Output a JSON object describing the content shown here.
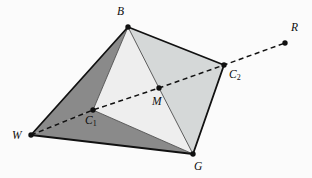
{
  "figure": {
    "type": "geometry-diagram",
    "width": 312,
    "height": 178,
    "background": "#fbfbfb"
  },
  "colors": {
    "stroke": "#111111",
    "dark_face": "#8a8a8a",
    "mid_face": "#d5d8d8",
    "light_face": "#eeeeee",
    "inner_stroke": "#4d4d4d",
    "dash": "#111111",
    "label": "#0d0d0d"
  },
  "points": [
    {
      "id": "W",
      "label": "W",
      "sub": "",
      "x": 31,
      "y": 135,
      "label_x": 12,
      "label_y": 130,
      "dot": true
    },
    {
      "id": "B",
      "label": "B",
      "sub": "",
      "x": 128,
      "y": 27,
      "label_x": 117,
      "label_y": 6,
      "dot": true
    },
    {
      "id": "G",
      "label": "G",
      "sub": "",
      "x": 193,
      "y": 154,
      "label_x": 194,
      "label_y": 161,
      "dot": true
    },
    {
      "id": "C2",
      "label": "C",
      "sub": "2",
      "x": 224,
      "y": 65,
      "label_x": 229,
      "label_y": 69,
      "dot": true
    },
    {
      "id": "C1",
      "label": "C",
      "sub": "1",
      "x": 93,
      "y": 110,
      "label_x": 85,
      "label_y": 115,
      "dot": true
    },
    {
      "id": "M",
      "label": "M",
      "sub": "",
      "x": 159,
      "y": 88,
      "label_x": 152,
      "label_y": 96,
      "dot": true
    },
    {
      "id": "R",
      "label": "R",
      "sub": "",
      "x": 285,
      "y": 43,
      "label_x": 291,
      "label_y": 22,
      "dot": true
    }
  ],
  "faces": [
    {
      "id": "face-W-B-C1",
      "points": "31,135 128,27 93,110",
      "fill": "#8a8a8a",
      "stroke": "none"
    },
    {
      "id": "face-W-C1-G",
      "points": "31,135 93,110 193,154",
      "fill": "#8a8a8a",
      "stroke": "none"
    },
    {
      "id": "face-B-C1-M",
      "points": "128,27 93,110 159,88",
      "fill": "#eeeeee",
      "stroke": "none"
    },
    {
      "id": "face-C1-M-G",
      "points": "93,110 159,88 193,154",
      "fill": "#eeeeee",
      "stroke": "none"
    },
    {
      "id": "face-B-M-C2",
      "points": "128,27 159,88 224,65",
      "fill": "#d5d8d8",
      "stroke": "none"
    },
    {
      "id": "face-M-C2-G",
      "points": "159,88 224,65 193,154",
      "fill": "#d5d8d8",
      "stroke": "none"
    }
  ],
  "inner_edges": [
    {
      "id": "edge-B-C1",
      "x1": 128,
      "y1": 27,
      "x2": 93,
      "y2": 110
    },
    {
      "id": "edge-B-M",
      "x1": 128,
      "y1": 27,
      "x2": 159,
      "y2": 88
    },
    {
      "id": "edge-M-G",
      "x1": 159,
      "y1": 88,
      "x2": 193,
      "y2": 154
    },
    {
      "id": "edge-C1-G",
      "x1": 93,
      "y1": 110,
      "x2": 193,
      "y2": 154
    }
  ],
  "outline_edges": [
    {
      "id": "edge-W-B",
      "x1": 31,
      "y1": 135,
      "x2": 128,
      "y2": 27
    },
    {
      "id": "edge-B-C2",
      "x1": 128,
      "y1": 27,
      "x2": 224,
      "y2": 65
    },
    {
      "id": "edge-C2-G",
      "x1": 224,
      "y1": 65,
      "x2": 193,
      "y2": 154
    },
    {
      "id": "edge-G-W",
      "x1": 193,
      "y1": 154,
      "x2": 31,
      "y2": 135
    }
  ],
  "dashed_line": {
    "id": "line-W-C1-M-C2-R",
    "points": "31,135 93,110 159,88 224,65 285,43",
    "dasharray": "5 3.5",
    "width": 1.5
  },
  "dot_radius": 2.7
}
